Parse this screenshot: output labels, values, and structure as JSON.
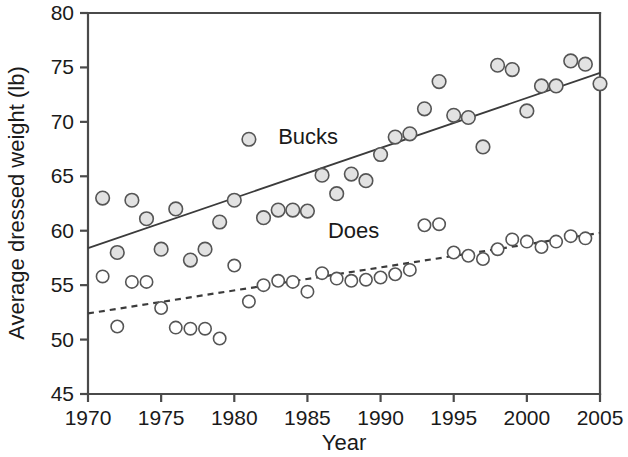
{
  "chart_data": {
    "type": "scatter",
    "title": "",
    "xlabel": "Year",
    "ylabel": "Average dressed weight (lb)",
    "xlim": [
      1970,
      2005
    ],
    "ylim": [
      45,
      80
    ],
    "xticks": [
      1970,
      1975,
      1980,
      1985,
      1990,
      1995,
      2000,
      2005
    ],
    "yticks": [
      45,
      50,
      55,
      60,
      65,
      70,
      75,
      80
    ],
    "xtick_labels": [
      "1970",
      "1975",
      "1980",
      "1985",
      "1990",
      "1995",
      "2000",
      "2005"
    ],
    "ytick_labels": [
      "45",
      "50",
      "55",
      "60",
      "65",
      "70",
      "75",
      "80"
    ],
    "grid": false,
    "legend_position": "inline-annotation",
    "annotations": [
      {
        "text": "Bucks",
        "x": 1983.0,
        "y": 68.0
      },
      {
        "text": "Does",
        "x": 1986.4,
        "y": 59.3
      }
    ],
    "series": [
      {
        "name": "Bucks",
        "marker": "filled-circle",
        "marker_fill": "#e2e2e2",
        "marker_edge": "#555555",
        "x": [
          1971,
          1972,
          1973,
          1974,
          1975,
          1976,
          1977,
          1978,
          1979,
          1980,
          1981,
          1982,
          1983,
          1984,
          1985,
          1986,
          1987,
          1988,
          1989,
          1990,
          1991,
          1992,
          1993,
          1994,
          1995,
          1996,
          1997,
          1998,
          1999,
          2000,
          2001,
          2002,
          2003,
          2004,
          2005
        ],
        "y": [
          63.0,
          58.0,
          62.8,
          61.1,
          58.3,
          62.0,
          57.3,
          58.3,
          60.8,
          62.8,
          68.4,
          61.2,
          61.9,
          61.9,
          61.8,
          65.1,
          63.4,
          65.2,
          64.6,
          67.0,
          68.6,
          68.9,
          71.2,
          73.7,
          70.6,
          70.4,
          67.7,
          75.2,
          74.8,
          71.0,
          73.3,
          73.3,
          75.6,
          75.3,
          73.5
        ],
        "trendline": {
          "style": "solid",
          "x_start": 1970.0,
          "y_start": 58.4,
          "x_end": 2005.0,
          "y_end": 74.5
        }
      },
      {
        "name": "Does",
        "marker": "open-circle",
        "marker_fill": "#ffffff",
        "marker_edge": "#555555",
        "x": [
          1971,
          1972,
          1973,
          1974,
          1975,
          1976,
          1977,
          1978,
          1979,
          1980,
          1981,
          1982,
          1983,
          1984,
          1985,
          1986,
          1987,
          1988,
          1989,
          1990,
          1991,
          1992,
          1993,
          1994,
          1995,
          1996,
          1997,
          1998,
          1999,
          2000,
          2001,
          2002,
          2003,
          2004
        ],
        "y": [
          55.8,
          51.2,
          55.3,
          55.3,
          52.9,
          51.1,
          51.0,
          51.0,
          50.1,
          56.8,
          53.5,
          55.0,
          55.4,
          55.3,
          54.4,
          56.1,
          55.6,
          55.4,
          55.5,
          55.7,
          56.0,
          56.4,
          60.5,
          60.6,
          58.0,
          57.7,
          57.4,
          58.3,
          59.2,
          59.0,
          58.5,
          59.0,
          59.5,
          59.3
        ],
        "trendline": {
          "style": "dashed",
          "x_start": 1970.0,
          "y_start": 52.4,
          "x_end": 2005.0,
          "y_end": 59.8
        }
      }
    ]
  },
  "plot_geometry": {
    "left_px": 88,
    "right_px": 600,
    "top_px": 13,
    "bottom_px": 394
  }
}
